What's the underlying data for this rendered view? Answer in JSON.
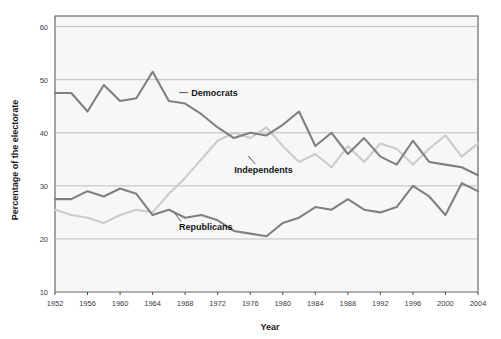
{
  "chart_data": {
    "type": "line",
    "title": "",
    "xlabel": "Year",
    "ylabel": "Percentage of the electorate",
    "xlim": [
      1952,
      2004
    ],
    "ylim": [
      10,
      62
    ],
    "yticks": [
      10,
      20,
      30,
      40,
      50,
      60
    ],
    "xticks": [
      1952,
      1956,
      1960,
      1964,
      1968,
      1972,
      1976,
      1980,
      1984,
      1988,
      1992,
      1996,
      2000,
      2004
    ],
    "grid": "horizontal",
    "legend_position": "inline-annotations",
    "x": [
      1952,
      1954,
      1956,
      1958,
      1960,
      1962,
      1964,
      1966,
      1968,
      1970,
      1972,
      1974,
      1976,
      1978,
      1980,
      1982,
      1984,
      1986,
      1988,
      1990,
      1992,
      1994,
      1996,
      1998,
      2000,
      2002,
      2004
    ],
    "series": [
      {
        "name": "Democrats",
        "color": "#808080",
        "label_x": 1968,
        "label_y": 47,
        "values": [
          47.5,
          47.5,
          44.0,
          49.0,
          46.0,
          46.5,
          51.5,
          46.0,
          45.5,
          43.5,
          41.0,
          39.0,
          40.0,
          39.5,
          41.5,
          44.0,
          37.5,
          40.0,
          36.0,
          39.0,
          35.5,
          34.0,
          38.5,
          34.5,
          34.0,
          33.5,
          32.0
        ]
      },
      {
        "name": "Independents",
        "color": "#cccccc",
        "label_x": 1976,
        "label_y": 33,
        "values": [
          25.5,
          24.5,
          24.0,
          23.0,
          24.5,
          25.5,
          25.0,
          28.5,
          31.5,
          35.0,
          38.5,
          40.0,
          39.0,
          41.0,
          37.5,
          34.5,
          36.0,
          33.5,
          37.5,
          34.5,
          38.0,
          37.0,
          34.0,
          37.0,
          39.5,
          35.5,
          38.0
        ]
      },
      {
        "name": "Republicans",
        "color": "#808080",
        "label_x": 1967,
        "label_y": 22.5,
        "values": [
          27.5,
          27.5,
          29.0,
          28.0,
          29.5,
          28.5,
          24.5,
          25.5,
          24.0,
          24.5,
          23.5,
          21.5,
          21.0,
          20.5,
          23.0,
          24.0,
          26.0,
          25.5,
          27.5,
          25.5,
          25.0,
          26.0,
          30.0,
          28.0,
          24.5,
          30.5,
          29.0
        ]
      }
    ]
  },
  "labels": {
    "xlabel": "Year",
    "ylabel": "Percentage of the electorate",
    "democrats": "Democrats",
    "independents": "Independents",
    "republicans": "Republicans"
  }
}
